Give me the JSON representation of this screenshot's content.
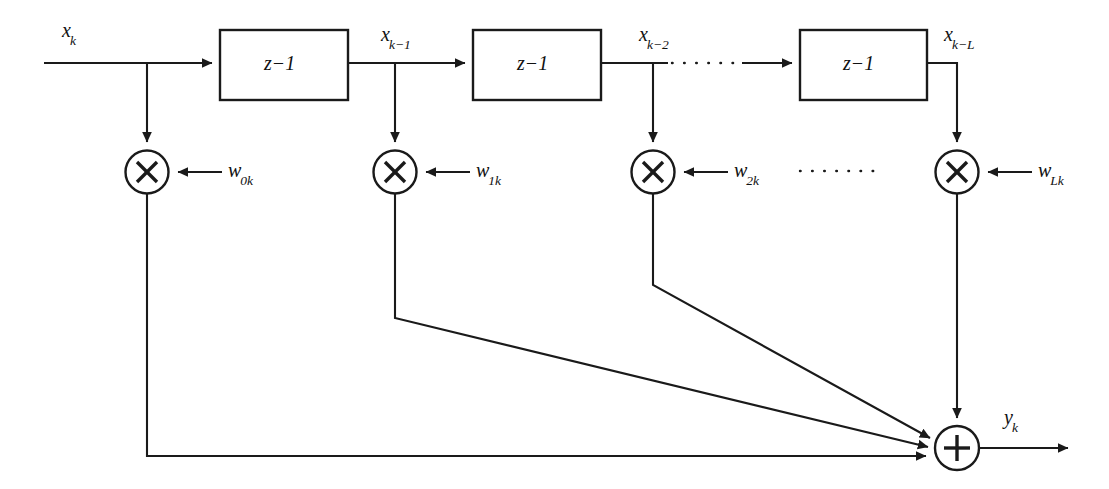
{
  "figure": {
    "kind": "block-diagram",
    "background_color": "#ffffff",
    "line_color": "#1a1a1a"
  },
  "signals": {
    "input_label_main": "x",
    "input_label_sub": "k",
    "tap_labels": [
      {
        "base": "x",
        "sub": "k"
      },
      {
        "base": "x",
        "sub": "k−1"
      },
      {
        "base": "x",
        "sub": "k−2"
      },
      {
        "base": "x",
        "sub": "k−L"
      }
    ],
    "output_label": {
      "base": "y",
      "sub": "k"
    }
  },
  "delay_blocks": [
    {
      "name": "delay-1",
      "base": "z",
      "exponent": "−1"
    },
    {
      "name": "delay-2",
      "base": "z",
      "exponent": "−1"
    },
    {
      "name": "delay-3",
      "base": "z",
      "exponent": "−1"
    }
  ],
  "weights": [
    {
      "base": "w",
      "sub": "0k"
    },
    {
      "base": "w",
      "sub": "1k"
    },
    {
      "base": "w",
      "sub": "2k"
    },
    {
      "base": "w",
      "sub": "Lk"
    }
  ],
  "operators": {
    "multiply_glyph": "×",
    "sum_glyph": "+",
    "multiplier_count": 4,
    "summer_count": 1
  },
  "continuation": {
    "ellipsis_top": "· · · · · ·",
    "ellipsis_mid": "· · · · · ·"
  }
}
